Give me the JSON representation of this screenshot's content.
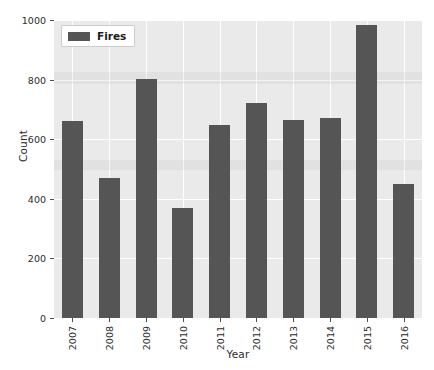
{
  "chart_data": {
    "type": "bar",
    "title": "",
    "xlabel": "Year",
    "ylabel": "Count",
    "categories": [
      "2007",
      "2008",
      "2009",
      "2010",
      "2011",
      "2012",
      "2013",
      "2014",
      "2015",
      "2016"
    ],
    "values": [
      661,
      470,
      802,
      369,
      648,
      721,
      664,
      671,
      983,
      450
    ],
    "series": [
      {
        "name": "Fires",
        "values": [
          661,
          470,
          802,
          369,
          648,
          721,
          664,
          671,
          983,
          450
        ]
      }
    ],
    "ylim": [
      0,
      1000
    ],
    "yticks": [
      0,
      200,
      400,
      600,
      800,
      1000
    ],
    "ytick_labels": [
      "0",
      "200",
      "400",
      "600",
      "800",
      "1000"
    ],
    "xtick_labels": [
      "2007",
      "2008",
      "2009",
      "2010",
      "2011",
      "2012",
      "2013",
      "2014",
      "2015",
      "2016"
    ],
    "grid": true,
    "legend": {
      "position": "upper left",
      "entries": [
        "Fires"
      ]
    },
    "colors": {
      "bar": "#555555",
      "plot_background": "#eaeaea",
      "gridline": "#ffffff",
      "text": "#2b2b2b",
      "figure_background": "#ffffff"
    }
  }
}
